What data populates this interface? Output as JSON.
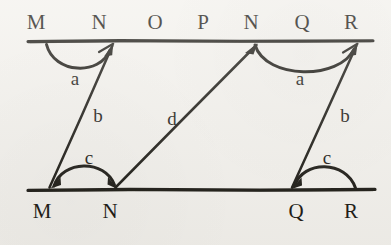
{
  "figure": {
    "background_color": "#f3f1ec",
    "ink_color": "#17150f",
    "top_line": {
      "name": "upper-parallel-line",
      "x1": 28,
      "x2": 373,
      "y": 41
    },
    "bottom_line": {
      "name": "lower-parallel-line",
      "x1": 28,
      "x2": 375,
      "y": 190
    },
    "top_labels": [
      {
        "text": "M",
        "x": 36,
        "y": 22
      },
      {
        "text": "N",
        "x": 99,
        "y": 22
      },
      {
        "text": "O",
        "x": 155,
        "y": 22
      },
      {
        "text": "P",
        "x": 203,
        "y": 22
      },
      {
        "text": "N",
        "x": 251,
        "y": 22
      },
      {
        "text": "Q",
        "x": 302,
        "y": 22
      },
      {
        "text": "R",
        "x": 351,
        "y": 22
      }
    ],
    "bottom_labels": [
      {
        "text": "M",
        "x": 42,
        "y": 211
      },
      {
        "text": "N",
        "x": 110,
        "y": 211
      },
      {
        "text": "Q",
        "x": 296,
        "y": 211
      },
      {
        "text": "R",
        "x": 351,
        "y": 211
      }
    ],
    "angle_labels": [
      {
        "text": "a",
        "x": 75,
        "y": 78,
        "position": "left-upper-angle"
      },
      {
        "text": "a",
        "x": 300,
        "y": 78,
        "position": "right-upper-angle"
      },
      {
        "text": "c",
        "x": 89,
        "y": 157,
        "position": "left-lower-angle"
      },
      {
        "text": "c",
        "x": 327,
        "y": 157,
        "position": "right-lower-angle"
      }
    ],
    "side_labels": [
      {
        "text": "b",
        "x": 98,
        "y": 115,
        "position": "left-transversal"
      },
      {
        "text": "d",
        "x": 172,
        "y": 118,
        "position": "middle-transversal"
      },
      {
        "text": "b",
        "x": 345,
        "y": 115,
        "position": "right-transversal"
      }
    ],
    "transversals": [
      {
        "name": "left-transversal-b",
        "x1": 50,
        "y1": 188,
        "x2": 113,
        "y2": 44,
        "arrow_at": "top"
      },
      {
        "name": "middle-transversal-d",
        "x1": 116,
        "y1": 188,
        "x2": 257,
        "y2": 44,
        "arrow_at": "top"
      },
      {
        "name": "right-transversal-b",
        "x1": 292,
        "y1": 188,
        "x2": 357,
        "y2": 44,
        "arrow_at": "top"
      }
    ],
    "arcs": [
      {
        "name": "angle-arc-a-left",
        "start_x": 48,
        "start_y": 46,
        "end_x": 112,
        "end_y": 46,
        "sweep": "down",
        "bulge": 26,
        "arrow_at": "end"
      },
      {
        "name": "angle-arc-a-right",
        "start_x": 256,
        "start_y": 46,
        "end_x": 355,
        "end_y": 46,
        "sweep": "down",
        "bulge": 26,
        "arrow_at": "end"
      },
      {
        "name": "angle-arc-c-left",
        "start_x": 52,
        "start_y": 186,
        "end_x": 115,
        "end_y": 186,
        "sweep": "up",
        "bulge": 22,
        "arrow_at": "both"
      },
      {
        "name": "angle-arc-c-right",
        "start_x": 293,
        "start_y": 186,
        "end_x": 356,
        "end_y": 186,
        "sweep": "up",
        "bulge": 22,
        "arrow_at": "start"
      }
    ]
  }
}
